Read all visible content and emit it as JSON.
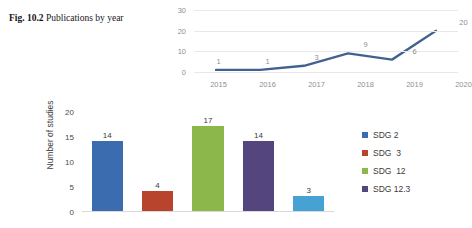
{
  "caption": {
    "label": "Fig. 10.2",
    "text": "Publications by year"
  },
  "chart_data": [
    {
      "id": "publications-by-year",
      "type": "line",
      "title": "",
      "xlabel": "",
      "ylabel": "",
      "categories": [
        "2015",
        "2016",
        "2017",
        "2018",
        "2019",
        "2020"
      ],
      "values": [
        1,
        1,
        3,
        9,
        6,
        20
      ],
      "data_labels": [
        "1",
        "1",
        "3",
        "9",
        "6",
        "20"
      ],
      "ylim": [
        0,
        30
      ],
      "yticks": [
        0,
        10,
        20,
        30
      ],
      "ytick_labels": [
        "0",
        "10",
        "20",
        "30"
      ],
      "grid": true,
      "legend": false,
      "series_color": "#41618f"
    },
    {
      "id": "studies-by-sdg",
      "type": "bar",
      "title": "",
      "xlabel": "",
      "ylabel": "Number of studies",
      "categories": [
        "SDG 2",
        "SDG  3",
        "SDG  12",
        "SDG 12.3",
        ""
      ],
      "values": [
        14,
        4,
        17,
        14,
        3
      ],
      "data_labels": [
        "14",
        "4",
        "17",
        "14",
        "3"
      ],
      "ylim": [
        0,
        20
      ],
      "yticks": [
        0,
        5,
        10,
        15,
        20
      ],
      "ytick_labels": [
        "0",
        "5",
        "10",
        "15",
        "20"
      ],
      "bar_colors": [
        "#3c6cb0",
        "#b9442e",
        "#8cb84b",
        "#55457e",
        "#45a2d2"
      ],
      "grid": false,
      "legend": true,
      "legend_position": "right",
      "legend_entries": [
        {
          "label": "SDG 2",
          "color": "#3c6cb0"
        },
        {
          "label": "SDG  3",
          "color": "#b9442e"
        },
        {
          "label": "SDG  12",
          "color": "#8cb84b"
        },
        {
          "label": "SDG 12.3",
          "color": "#55457e"
        }
      ]
    }
  ]
}
